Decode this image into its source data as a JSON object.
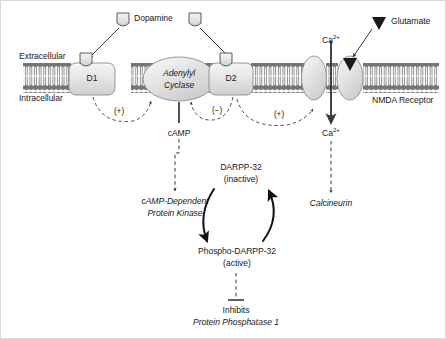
{
  "figure": {
    "type": "biological-signaling-pathway-diagram",
    "background_color": "#ffffff",
    "ink_color": "#1a1a1a",
    "protein_fill": "#e2e2e2",
    "membrane_head_color": "#6e6e6e"
  },
  "membrane": {
    "extracellular_label": "Extracellular",
    "intracellular_label": "Intracellular"
  },
  "ligands": {
    "dopamine_label": "Dopamine",
    "dopamine_icon": "shield-ligand-icon",
    "glutamate_label": "Glutamate",
    "glutamate_icon": "filled-triangle-ligand-icon"
  },
  "receptors": [
    {
      "id": "d1",
      "label": "D1",
      "shape": "rounded-rect"
    },
    {
      "id": "d2",
      "label": "D2",
      "shape": "rounded-rect"
    },
    {
      "id": "nmda",
      "label": "NMDA Receptor",
      "shape": "ellipse-pair-channel"
    }
  ],
  "enzymes": {
    "adenylyl_cyclase_line1": "Adenylyl",
    "adenylyl_cyclase_line2": "Cyclase",
    "camp_label": "cAMP",
    "pka_line1": "cAMP-Dependent",
    "pka_line2": "Protein Kinase",
    "calcineurin_label": "Calcineurin"
  },
  "ions": {
    "calcium_extracellular": "Ca",
    "calcium_extracellular_sup": "2+",
    "calcium_intracellular": "Ca",
    "calcium_intracellular_sup": "2+"
  },
  "modulation_signs": {
    "d1_to_ac": "(+)",
    "d2_to_ac": "(−)",
    "d2_to_nmda": "(+)"
  },
  "darpp_cycle": {
    "inactive_line1": "DARPP-32",
    "inactive_line2": "(inactive)",
    "active_line1": "Phospho-DARPP-32",
    "active_line2": "(active)"
  },
  "effect": {
    "inhibits_label": "Inhibits",
    "target_label": "Protein Phosphatase 1"
  }
}
